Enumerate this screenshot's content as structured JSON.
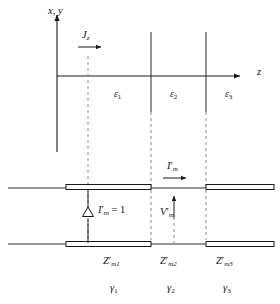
{
  "figure": {
    "title_desc": "Layered dielectric medium with current sheet and equivalent transmission line network",
    "upper": {
      "vertical_axis_label": "x, y",
      "horizontal_axis_label": "z",
      "source_label": "J",
      "source_sub": "z",
      "regions": [
        {
          "symbol": "ε",
          "sub": "1"
        },
        {
          "symbol": "ε",
          "sub": "2"
        },
        {
          "symbol": "ε",
          "sub": "3"
        }
      ]
    },
    "lower": {
      "current_source_label": "I",
      "current_source_prime": "′",
      "current_source_sub": "m",
      "current_source_value": "= 1",
      "line_current_label": "I",
      "line_current_prime": "′",
      "line_current_sub": "m",
      "voltage_label": "V",
      "voltage_prime": "′",
      "voltage_sub": "m",
      "impedances": [
        {
          "symbol": "Z",
          "prime": "′",
          "sub": "m1"
        },
        {
          "symbol": "Z",
          "prime": "′",
          "sub": "m2"
        },
        {
          "symbol": "Z",
          "prime": "′",
          "sub": "m3"
        }
      ],
      "propagation_constants": [
        {
          "symbol": "γ",
          "sub": "1"
        },
        {
          "symbol": "γ",
          "sub": "2"
        },
        {
          "symbol": "γ",
          "sub": "3"
        }
      ]
    },
    "colors": {
      "stroke": "#1a1a1a",
      "dashed": "#808080",
      "background": "#ffffff"
    }
  }
}
